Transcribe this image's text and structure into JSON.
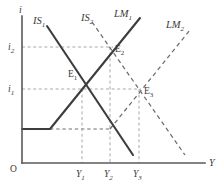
{
  "figure": {
    "type": "is-lm-diagram",
    "background_color": "#ffffff",
    "solid_curve_color": "#3d3d3d",
    "dashed_curve_color": "#6d6d6d",
    "guide_color": "#a8a8a8",
    "axis_color": "#5a5a5a"
  },
  "axes": {
    "vertical": {
      "name": "interest-rate-axis",
      "label": "i",
      "x": 22,
      "y_top": 16,
      "y_bottom": 163
    },
    "horizontal": {
      "name": "output-axis",
      "label": "Y",
      "label_x": 210,
      "label_y": 165,
      "y": 163,
      "x_left": 22,
      "x_right": 205
    },
    "origin": {
      "label": "O",
      "x": 12,
      "y": 170
    }
  },
  "y_ticks": [
    {
      "id": "i2",
      "base": "i",
      "sub": "2",
      "value_y": 47,
      "label_x": 9,
      "label_y": 50
    },
    {
      "id": "i1",
      "base": "i",
      "sub": "1",
      "value_y": 89,
      "label_x": 9,
      "label_y": 92
    }
  ],
  "x_ticks": [
    {
      "id": "Y1",
      "base": "Y",
      "sub": "1",
      "value_x": 82,
      "label_x": 77,
      "label_y": 176
    },
    {
      "id": "Y2",
      "base": "Y",
      "sub": "2",
      "value_x": 110,
      "label_x": 105,
      "label_y": 176
    },
    {
      "id": "Y3",
      "base": "Y",
      "sub": "3",
      "value_x": 139,
      "label_x": 134,
      "label_y": 176
    }
  ],
  "curves": [
    {
      "id": "IS1",
      "base": "IS",
      "sub": "1",
      "style": "solid",
      "label_x": 34,
      "label_y": 23,
      "points": "47,26 133,155"
    },
    {
      "id": "IS2",
      "base": "IS",
      "sub": "2",
      "style": "dashed",
      "label_x": 82,
      "label_y": 20,
      "points": "92,22 185,155"
    },
    {
      "id": "LM1",
      "base": "LM",
      "sub": "1",
      "style": "solid",
      "label_x": 116,
      "label_y": 16,
      "points": "22,129 50,129 140,18"
    },
    {
      "id": "LM2",
      "base": "LM",
      "sub": "2",
      "style": "dashed",
      "label_x": 168,
      "label_y": 27,
      "points": "110,129 190,30"
    }
  ],
  "equilibria": [
    {
      "id": "E1",
      "base": "E",
      "sub": "1",
      "x": 82,
      "y": 89,
      "label_x": 69,
      "label_y": 76
    },
    {
      "id": "E2",
      "base": "E",
      "sub": "2",
      "x": 111,
      "y": 47,
      "label_x": 116,
      "label_y": 51
    },
    {
      "id": "E3",
      "base": "E",
      "sub": "3",
      "x": 139,
      "y": 89,
      "label_x": 145,
      "label_y": 93
    }
  ],
  "guides": {
    "horizontal": [
      {
        "name": "guide-i2",
        "x1": 22,
        "x2": 113,
        "y": 47
      },
      {
        "name": "guide-i1",
        "x1": 22,
        "x2": 141,
        "y": 89
      },
      {
        "name": "guide-trap",
        "x1": 50,
        "x2": 111,
        "y": 129,
        "style": "dark"
      }
    ],
    "vertical": [
      {
        "name": "guide-Y1",
        "x": 82,
        "y1": 89,
        "y2": 163
      },
      {
        "name": "guide-Y2",
        "x": 110,
        "y1": 47,
        "y2": 163
      },
      {
        "name": "guide-Y3",
        "x": 139,
        "y1": 89,
        "y2": 163
      }
    ]
  }
}
